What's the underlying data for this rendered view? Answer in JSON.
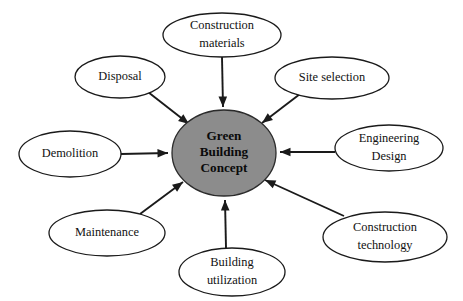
{
  "diagram": {
    "title": "Green Building Concept",
    "type": "radial-concept-map",
    "colors": {
      "center_fill": "#8c8c8c",
      "node_fill": "#ffffff",
      "stroke": "#1a1a1a",
      "background": "#ffffff"
    },
    "center": {
      "label_lines": [
        "Green",
        "Building",
        "Concept"
      ],
      "line1": "Green",
      "line2": "Building",
      "line3": "Concept",
      "cx": 224,
      "cy": 153,
      "rx": 52,
      "ry": 43
    },
    "nodes": [
      {
        "id": "construction-materials",
        "label_lines": [
          "Construction",
          "materials"
        ],
        "line1": "Construction",
        "line2": "materials",
        "cx": 222,
        "cy": 35,
        "rx": 59,
        "ry": 22,
        "arrow_from": [
          222,
          57
        ],
        "arrow_to": [
          223,
          107
        ]
      },
      {
        "id": "disposal",
        "label_lines": [
          "Disposal"
        ],
        "line1": "Disposal",
        "line2": "",
        "cx": 120,
        "cy": 77,
        "rx": 45,
        "ry": 21,
        "arrow_from": [
          148,
          92
        ],
        "arrow_to": [
          189,
          124
        ]
      },
      {
        "id": "site-selection",
        "label_lines": [
          "Site selection"
        ],
        "line1": "Site selection",
        "line2": "",
        "cx": 332,
        "cy": 78,
        "rx": 57,
        "ry": 21,
        "arrow_from": [
          300,
          94
        ],
        "arrow_to": [
          262,
          123
        ]
      },
      {
        "id": "engineering-design",
        "label_lines": [
          "Engineering",
          "Design"
        ],
        "line1": "Engineering",
        "line2": "Design",
        "cx": 389,
        "cy": 148,
        "rx": 54,
        "ry": 23,
        "arrow_from": [
          335,
          152
        ],
        "arrow_to": [
          280,
          152
        ]
      },
      {
        "id": "construction-technology",
        "label_lines": [
          "Construction",
          "technology"
        ],
        "line1": "Construction",
        "line2": "technology",
        "cx": 385,
        "cy": 237,
        "rx": 62,
        "ry": 25,
        "arrow_from": [
          344,
          216
        ],
        "arrow_to": [
          265,
          180
        ]
      },
      {
        "id": "building-utilization",
        "label_lines": [
          "Building",
          "utilization"
        ],
        "line1": "Building",
        "line2": "utilization",
        "cx": 232,
        "cy": 272,
        "rx": 53,
        "ry": 24,
        "arrow_from": [
          226,
          248
        ],
        "arrow_to": [
          225,
          200
        ]
      },
      {
        "id": "maintenance",
        "label_lines": [
          "Maintenance"
        ],
        "line1": "Maintenance",
        "line2": "",
        "cx": 107,
        "cy": 233,
        "rx": 58,
        "ry": 23,
        "arrow_from": [
          140,
          214
        ],
        "arrow_to": [
          183,
          182
        ]
      },
      {
        "id": "demolition",
        "label_lines": [
          "Demolition"
        ],
        "line1": "Demolition",
        "line2": "",
        "cx": 70,
        "cy": 154,
        "rx": 51,
        "ry": 23,
        "arrow_from": [
          121,
          154
        ],
        "arrow_to": [
          168,
          153
        ]
      }
    ]
  }
}
